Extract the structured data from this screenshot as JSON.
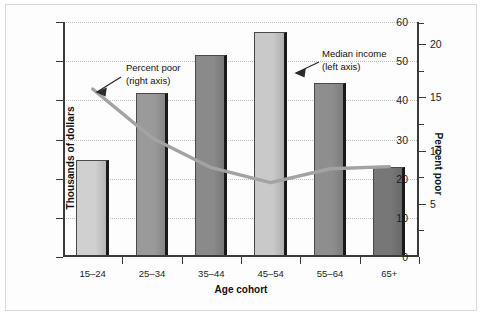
{
  "chart_data": {
    "type": "bar",
    "title": "",
    "xlabel": "Age cohort",
    "ylabel": "Thousands of dollars",
    "ylabel_right": "Percent poor",
    "categories": [
      "15–24",
      "25–34",
      "35–44",
      "45–54",
      "55–64",
      "65+"
    ],
    "ylim": [
      0,
      60
    ],
    "yticks": [
      0,
      10,
      20,
      30,
      40,
      50,
      60
    ],
    "ylim_right": [
      0,
      22.1
    ],
    "yticks_right": [
      5,
      10,
      15,
      20
    ],
    "yticks_right_minor": [
      2.5,
      7.5,
      12.5,
      17.5,
      22
    ],
    "grid": true,
    "legend_position": "annotations",
    "series": [
      {
        "name": "Median income (left axis)",
        "type": "bar",
        "axis": "left",
        "unit": "thousands of dollars",
        "values": [
          24.8,
          42.0,
          51.5,
          57.5,
          44.5,
          23.0
        ],
        "colors": [
          "#d0d0d0",
          "#9a9a9a",
          "#8a8a8a",
          "#c9c9c9",
          "#8e8e8e",
          "#777777"
        ]
      },
      {
        "name": "Percent poor (right axis)",
        "type": "line",
        "axis": "right",
        "unit": "percent",
        "values": [
          15.8,
          11.2,
          8.4,
          7.0,
          8.3,
          8.5
        ],
        "color": "#a3a3a3"
      }
    ],
    "annotations": [
      {
        "id": "percent-poor",
        "line1": "Percent poor",
        "line2": "(right axis)",
        "points_to": "line-series"
      },
      {
        "id": "median-income",
        "line1": "Median income",
        "line2": "(left axis)",
        "points_to": "bar-series"
      }
    ]
  },
  "style": {
    "axis_color": "#3a3a3a",
    "grid_color": "#bfbfc6",
    "text_color": "#111111",
    "line_color": "#a3a3a3",
    "bar_edge_color": "#4a4a4a",
    "bar_shadow_color": "#1a1a1a",
    "background": "#ffffff"
  }
}
